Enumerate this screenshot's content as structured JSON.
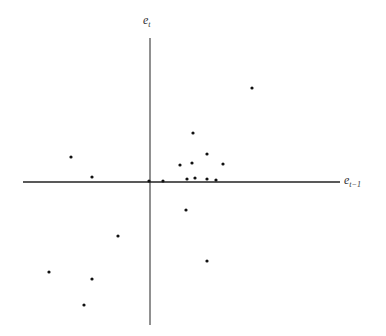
{
  "chart_data": {
    "type": "scatter",
    "title": "",
    "xlabel": "e_{t-1}",
    "ylabel": "e_t",
    "xlabel_main": "e",
    "xlabel_sub": "t−1",
    "ylabel_main": "e",
    "ylabel_sub": "t",
    "grid": false,
    "legend": null,
    "tick_labels": [],
    "axes_pixel": {
      "origin": [
        150,
        182
      ],
      "x_start": 23,
      "x_end": 340,
      "y_start": 38,
      "y_end": 325
    },
    "points_pixel": [
      [
        71,
        157
      ],
      [
        92,
        177
      ],
      [
        118,
        236
      ],
      [
        49,
        272
      ],
      [
        92,
        279
      ],
      [
        84,
        305
      ],
      [
        149,
        181
      ],
      [
        163,
        181
      ],
      [
        180,
        165
      ],
      [
        192,
        163
      ],
      [
        187,
        179
      ],
      [
        195,
        178
      ],
      [
        193,
        133
      ],
      [
        207,
        154
      ],
      [
        223,
        164
      ],
      [
        207,
        179
      ],
      [
        216,
        180
      ],
      [
        252,
        88
      ],
      [
        186,
        210
      ],
      [
        207,
        261
      ]
    ],
    "points": [
      {
        "x": -79,
        "y": 25
      },
      {
        "x": -58,
        "y": 5
      },
      {
        "x": -32,
        "y": -54
      },
      {
        "x": -101,
        "y": -90
      },
      {
        "x": -58,
        "y": -97
      },
      {
        "x": -66,
        "y": -123
      },
      {
        "x": -1,
        "y": 1
      },
      {
        "x": 13,
        "y": 1
      },
      {
        "x": 30,
        "y": 17
      },
      {
        "x": 42,
        "y": 19
      },
      {
        "x": 37,
        "y": 3
      },
      {
        "x": 45,
        "y": 4
      },
      {
        "x": 43,
        "y": 49
      },
      {
        "x": 57,
        "y": 28
      },
      {
        "x": 73,
        "y": 18
      },
      {
        "x": 57,
        "y": 3
      },
      {
        "x": 66,
        "y": 2
      },
      {
        "x": 102,
        "y": 94
      },
      {
        "x": 36,
        "y": -28
      },
      {
        "x": 57,
        "y": -79
      }
    ],
    "note": "No tick marks or numeric scale shown; point values are in pixel-relative units from the axis origin (y positive upward)."
  },
  "colors": {
    "axis": "#222222",
    "point": "#111111",
    "background": "#ffffff"
  }
}
